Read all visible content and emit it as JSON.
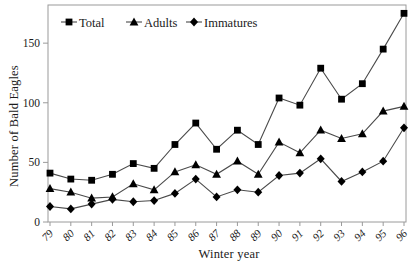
{
  "chart_data": {
    "type": "line",
    "title": "",
    "xlabel": "Winter year",
    "ylabel": "Number of Bald Eagles",
    "categories": [
      "79",
      "80",
      "81",
      "82",
      "83",
      "84",
      "85",
      "86",
      "87",
      "88",
      "89",
      "90",
      "91",
      "92",
      "93",
      "94",
      "95",
      "96"
    ],
    "series": [
      {
        "name": "Total",
        "marker": "square",
        "values": [
          41,
          36,
          35,
          40,
          49,
          45,
          65,
          83,
          61,
          77,
          65,
          104,
          98,
          129,
          103,
          116,
          145,
          175
        ]
      },
      {
        "name": "Adults",
        "marker": "triangle",
        "values": [
          28,
          25,
          20,
          21,
          32,
          27,
          42,
          48,
          40,
          51,
          40,
          67,
          58,
          77,
          70,
          74,
          93,
          97
        ]
      },
      {
        "name": "Immatures",
        "marker": "diamond",
        "values": [
          13,
          11,
          15,
          19,
          17,
          18,
          24,
          36,
          21,
          27,
          25,
          39,
          41,
          53,
          34,
          42,
          51,
          79
        ]
      }
    ],
    "y_ticks": [
      0,
      50,
      100,
      150
    ],
    "ylim": [
      0,
      182
    ],
    "grid": false,
    "legend_position": "top-left-inside",
    "colors": {
      "line": "#4a4a4a",
      "marker": "#000000",
      "frame": "#9a9a9a",
      "text": "#1a1a1a"
    }
  }
}
